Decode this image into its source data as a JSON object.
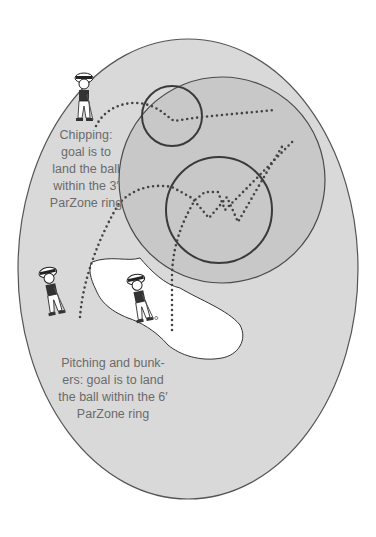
{
  "diagram": {
    "colors": {
      "background": "#ffffff",
      "green_fill": "#d9d9d9",
      "green_outline": "#555555",
      "fringe_circle_fill": "#c6c6c6",
      "ring_stroke": "#3a3a3a",
      "bunker_fill": "#ffffff",
      "trajectory_dots": "#444444",
      "label_text": "#6b6b6b"
    },
    "labels": {
      "chipping": {
        "lines": [
          "Chipping:",
          "goal is to",
          "land the ball",
          "within the 3′",
          "ParZone ring"
        ]
      },
      "pitching": {
        "lines": [
          "Pitching and bunk-",
          "ers: goal is to land",
          "the ball within the 6′",
          "ParZone ring"
        ]
      }
    },
    "rings": [
      {
        "name": "3-foot-parzone-ring",
        "cx": 172,
        "cy": 116,
        "r": 30
      },
      {
        "name": "6-foot-parzone-ring",
        "cx": 219,
        "cy": 210,
        "r": 53
      }
    ],
    "golfers": [
      {
        "name": "chipping-golfer",
        "x": 84,
        "y": 98
      },
      {
        "name": "fringe-pitching-golfer",
        "x": 52,
        "y": 292
      },
      {
        "name": "bunker-golfer",
        "x": 140,
        "y": 299
      }
    ]
  }
}
